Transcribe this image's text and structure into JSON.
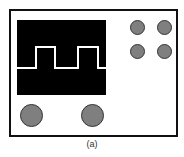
{
  "figure": {
    "caption": "(a)",
    "colors": {
      "frame": "#111111",
      "screen": "#000000",
      "wave": "#ffffff",
      "knob": "#7f7f7f"
    },
    "controls": {
      "small_knobs": 4,
      "large_knobs": 2
    }
  }
}
